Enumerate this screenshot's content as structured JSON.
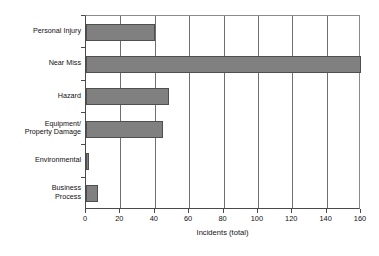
{
  "chart_data": {
    "type": "bar",
    "orientation": "horizontal",
    "title": "",
    "xlabel": "Incidents (total)",
    "ylabel": "",
    "categories": [
      "Personal Injury",
      "Near Miss",
      "Hazard",
      "Equipment/\nProperty Damage",
      "Environmental",
      "Business\nProcess"
    ],
    "values": [
      40,
      160,
      48,
      45,
      2,
      7
    ],
    "xlim": [
      0,
      160
    ],
    "xticks": [
      0,
      20,
      40,
      60,
      80,
      100,
      120,
      140,
      160
    ],
    "xticklabels": [
      "0",
      "20",
      "40",
      "60",
      "80",
      "100",
      "120",
      "140",
      "160"
    ],
    "grid": "vertical",
    "legend": "none",
    "bar_color": "#808080",
    "bar_edge_color": "#4f4f4f",
    "axis_color": "#4a4a4a",
    "background": "#ffffff"
  }
}
